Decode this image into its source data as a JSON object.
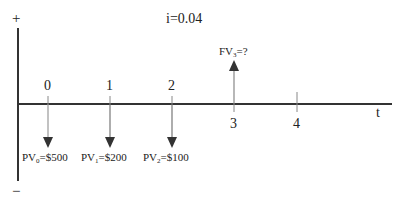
{
  "diagram": {
    "interest_rate_label": "i=0.04",
    "axis": {
      "positive_sign": "+",
      "negative_sign": "−",
      "time_label": "t",
      "ticks": [
        "0",
        "1",
        "2",
        "3",
        "4"
      ]
    },
    "cash_flows": [
      {
        "period": "0",
        "direction": "down",
        "prefix": "PV",
        "sub": "0",
        "suffix": "=$500"
      },
      {
        "period": "1",
        "direction": "down",
        "prefix": "PV",
        "sub": "1",
        "suffix": "=$200"
      },
      {
        "period": "2",
        "direction": "down",
        "prefix": "PV",
        "sub": "2",
        "suffix": "=$100"
      },
      {
        "period": "3",
        "direction": "up",
        "prefix": "FV",
        "sub": "3",
        "suffix": "=?"
      }
    ],
    "colors": {
      "axis": "#333333",
      "arrow": "#444444",
      "arrow_shaft": "#888888"
    }
  }
}
